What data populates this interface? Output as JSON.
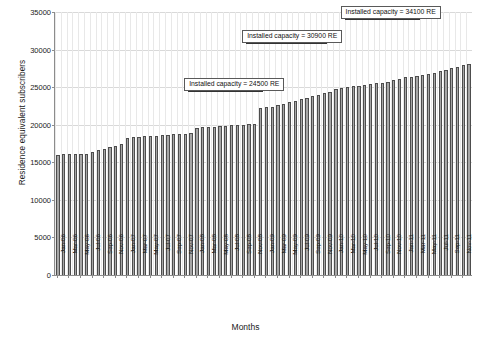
{
  "chart_data": {
    "type": "bar",
    "title": "",
    "xlabel": "Months",
    "ylabel": "Residence equivalent subscribers",
    "ylim": [
      0,
      35000
    ],
    "ytick_values": [
      0,
      5000,
      10000,
      15000,
      20000,
      25000,
      30000,
      35000
    ],
    "ytick_labels": [
      "0",
      "5000",
      "10000",
      "15000",
      "20000",
      "25000",
      "30000",
      "35000"
    ],
    "grid": true,
    "legend": "none",
    "categories": [
      "Jan-06",
      "Feb-06",
      "Mar-06",
      "Apr-06",
      "May-06",
      "Jun-06",
      "Jul-06",
      "Aug-06",
      "Sep-06",
      "Oct-06",
      "Nov-06",
      "Dec-06",
      "Jan-07",
      "Feb-07",
      "Mar-07",
      "Apr-07",
      "May-07",
      "Jun-07",
      "Jul-07",
      "Aug-07",
      "Sep-07",
      "Oct-07",
      "Nov-07",
      "Dec-07",
      "Jan-08",
      "Feb-08",
      "Mar-08",
      "Apr-08",
      "May-08",
      "Jun-08",
      "Jul-08",
      "Aug-08",
      "Sep-08",
      "Oct-08",
      "Nov-08",
      "Dec-08",
      "Jan-09",
      "Feb-09",
      "Mar-09",
      "Apr-09",
      "May-09",
      "Jun-09",
      "Jul-09",
      "Aug-09",
      "Sep-09",
      "Oct-09",
      "Nov-09",
      "Dec-09",
      "Jan-10",
      "Feb-10",
      "Mar-10",
      "Apr-10",
      "May-10",
      "Jun-10",
      "Jul-10",
      "Aug-10",
      "Sep-10",
      "Oct-10",
      "Nov-10",
      "Dec-10",
      "Jan-11",
      "Feb-11",
      "Mar-11",
      "Apr-11",
      "May-11",
      "Jun-11",
      "Jul-11",
      "Aug-11",
      "Sep-11",
      "Oct-11",
      "Nov-11",
      "Dec-11"
    ],
    "xtick_labels": [
      "Jan-06",
      "Mar-06",
      "May-06",
      "Jul-06",
      "Sep-06",
      "Nov-06",
      "Jan-07",
      "Mar-07",
      "May-07",
      "Jul-07",
      "Sep-07",
      "Nov-07",
      "Jan-08",
      "Mar-08",
      "May-08",
      "Jul-08",
      "Sep-08",
      "Nov-08",
      "Jan-09",
      "Mar-09",
      "May-09",
      "Jul-09",
      "Sep-09",
      "Nov-09",
      "Jan-10",
      "Mar-10",
      "May-10",
      "Jul-10",
      "Sep-10",
      "Nov-10",
      "Jan-11",
      "Mar-11",
      "May-11",
      "Jul-11",
      "Sep-11",
      "Nov-11"
    ],
    "values": [
      16000,
      16050,
      16050,
      16100,
      16100,
      16150,
      16400,
      16600,
      16800,
      17000,
      17200,
      17400,
      18300,
      18350,
      18400,
      18450,
      18500,
      18550,
      18600,
      18650,
      18700,
      18750,
      18800,
      18850,
      19600,
      19650,
      19700,
      19750,
      19800,
      19850,
      19900,
      19950,
      20000,
      20050,
      20100,
      22200,
      22300,
      22400,
      22600,
      22800,
      23000,
      23200,
      23400,
      23600,
      23800,
      24000,
      24200,
      24400,
      24700,
      24900,
      25000,
      25100,
      25200,
      25300,
      25400,
      25500,
      25600,
      25700,
      25900,
      26100,
      26300,
      26400,
      26500,
      26600,
      26700,
      26900,
      27100,
      27300,
      27500,
      27700,
      27900,
      28100
    ],
    "annotations": [
      {
        "label": "Installed capacity = 24500 RE",
        "value": 24500,
        "from_index": 23,
        "to_index": 35
      },
      {
        "label": "Installed capacity = 30900 RE",
        "value": 30900,
        "from_index": 33,
        "to_index": 46
      },
      {
        "label": "Installed capacity = 34100 RE",
        "value": 34100,
        "from_index": 50,
        "to_index": 62
      }
    ],
    "bar_color": "#a6a6a6",
    "bar_edge_color": "#4d4d4d",
    "grid_color": "#d9d9d9",
    "axis_color": "#8c8c8c"
  }
}
